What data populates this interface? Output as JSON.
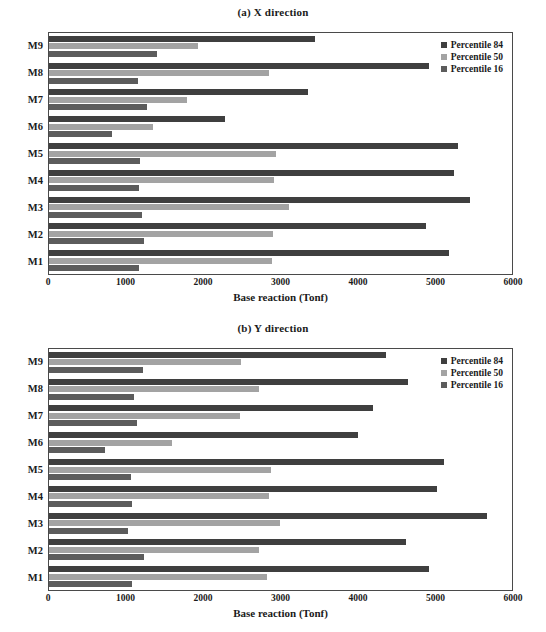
{
  "figure": {
    "axis_title": "Base reaction (Tonf)",
    "x_ticks": [
      "0",
      "1000",
      "2000",
      "3000",
      "4000",
      "5000",
      "6000"
    ],
    "categories": [
      "M9",
      "M8",
      "M7",
      "M6",
      "M5",
      "M4",
      "M3",
      "M2",
      "M1"
    ],
    "legend": [
      {
        "label": "Percentile 84",
        "color": "#3f3f3f"
      },
      {
        "label": "Percentile 50",
        "color": "#a3a3a3"
      },
      {
        "label": "Percentile 16",
        "color": "#5c5c5c"
      }
    ],
    "panel_a_title": "(a) X direction",
    "panel_b_title": "(b) Y direction"
  },
  "chart_data": [
    {
      "type": "bar",
      "orientation": "horizontal",
      "title": "(a) X direction",
      "xlabel": "Base reaction (Tonf)",
      "ylabel": "",
      "xlim": [
        0,
        6000
      ],
      "xticks": [
        0,
        1000,
        2000,
        3000,
        4000,
        5000,
        6000
      ],
      "grid": false,
      "legend_position": "top-right",
      "categories": [
        "M9",
        "M8",
        "M7",
        "M6",
        "M5",
        "M4",
        "M3",
        "M2",
        "M1"
      ],
      "series": [
        {
          "name": "Percentile 84",
          "color": "#3f3f3f",
          "values": [
            3445,
            4930,
            3360,
            2280,
            5300,
            5250,
            5450,
            4880,
            5180
          ]
        },
        {
          "name": "Percentile 50",
          "color": "#a3a3a3",
          "values": [
            1930,
            2850,
            1790,
            1350,
            2940,
            2920,
            3110,
            2900,
            2890
          ]
        },
        {
          "name": "Percentile 16",
          "color": "#5c5c5c",
          "values": [
            1400,
            1150,
            1270,
            820,
            1180,
            1170,
            1210,
            1230,
            1170
          ]
        }
      ]
    },
    {
      "type": "bar",
      "orientation": "horizontal",
      "title": "(b) Y direction",
      "xlabel": "Base reaction (Tonf)",
      "ylabel": "",
      "xlim": [
        0,
        6000
      ],
      "xticks": [
        0,
        1000,
        2000,
        3000,
        4000,
        5000,
        6000
      ],
      "grid": false,
      "legend_position": "top-right",
      "categories": [
        "M9",
        "M8",
        "M7",
        "M6",
        "M5",
        "M4",
        "M3",
        "M2",
        "M1"
      ],
      "series": [
        {
          "name": "Percentile 84",
          "color": "#3f3f3f",
          "values": [
            4370,
            4650,
            4200,
            4000,
            5120,
            5030,
            5670,
            4630,
            4930
          ]
        },
        {
          "name": "Percentile 50",
          "color": "#a3a3a3",
          "values": [
            2490,
            2720,
            2480,
            1600,
            2880,
            2850,
            2990,
            2720,
            2820
          ]
        },
        {
          "name": "Percentile 16",
          "color": "#5c5c5c",
          "values": [
            1220,
            1100,
            1140,
            730,
            1060,
            1070,
            1020,
            1230,
            1080
          ]
        }
      ]
    }
  ]
}
